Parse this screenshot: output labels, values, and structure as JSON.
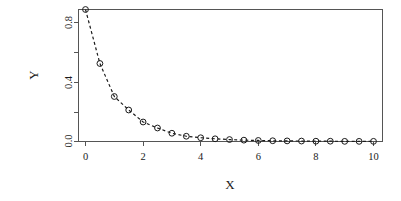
{
  "chart_data": {
    "type": "scatter",
    "title": "",
    "xlabel": "X",
    "ylabel": "Y",
    "xlim": [
      0,
      10
    ],
    "ylim": [
      0,
      0.9
    ],
    "grid": false,
    "legend": null,
    "line_style": "dashed",
    "marker": "open-circle",
    "x_ticks": [
      0,
      2,
      4,
      6,
      8,
      10
    ],
    "x_tick_labels": [
      "0",
      "2",
      "4",
      "6",
      "8",
      "10"
    ],
    "x_minor_ticks": [],
    "y_ticks": [
      0.0,
      0.2,
      0.4,
      0.6,
      0.8
    ],
    "y_tick_labels": [
      "0.0",
      "",
      "0.4",
      "",
      "0.8"
    ],
    "x": [
      0,
      0.5,
      1,
      1.5,
      2,
      2.5,
      3,
      3.5,
      4,
      4.5,
      5,
      5.5,
      6,
      6.5,
      7,
      7.5,
      8,
      8.5,
      9,
      9.5,
      10
    ],
    "y": [
      0.88,
      0.52,
      0.3,
      0.21,
      0.13,
      0.09,
      0.055,
      0.035,
      0.025,
      0.018,
      0.013,
      0.009,
      0.007,
      0.005,
      0.004,
      0.003,
      0.002,
      0.002,
      0.001,
      0.001,
      0.001
    ],
    "series": [
      {
        "name": "decay",
        "values": [
          0.88,
          0.52,
          0.3,
          0.21,
          0.13,
          0.09,
          0.055,
          0.035,
          0.025,
          0.018,
          0.013,
          0.009,
          0.007,
          0.005,
          0.004,
          0.003,
          0.002,
          0.002,
          0.001,
          0.001,
          0.001
        ]
      }
    ],
    "colors": {
      "point": "#1a1a1a",
      "line": "#1a1a1a",
      "frame": "#555555",
      "background": "#ffffff"
    }
  }
}
